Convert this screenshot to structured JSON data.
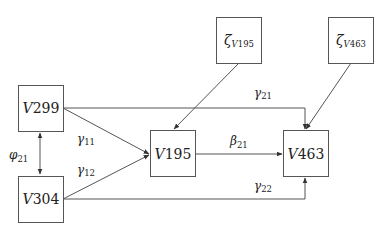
{
  "diagram": {
    "type": "path-diagram",
    "nodes": [
      {
        "id": "V299",
        "prefix": "V",
        "num": "299"
      },
      {
        "id": "V304",
        "prefix": "V",
        "num": "304"
      },
      {
        "id": "V195",
        "prefix": "V",
        "num": "195"
      },
      {
        "id": "V463",
        "prefix": "V",
        "num": "463"
      },
      {
        "id": "zetaV195",
        "greek": "ζ",
        "sub_var": "V",
        "sub_num": "195"
      },
      {
        "id": "zetaV463",
        "greek": "ζ",
        "sub_var": "V",
        "sub_num": "463"
      }
    ],
    "edges": [
      {
        "from": "V299",
        "to": "V304",
        "type": "bidirectional",
        "label_greek": "φ",
        "label_sub": "21"
      },
      {
        "from": "V299",
        "to": "V195",
        "type": "directed",
        "label_greek": "γ",
        "label_sub": "11"
      },
      {
        "from": "V304",
        "to": "V195",
        "type": "directed",
        "label_greek": "γ",
        "label_sub": "12"
      },
      {
        "from": "V299",
        "to": "V463",
        "type": "directed",
        "label_greek": "γ",
        "label_sub": "21"
      },
      {
        "from": "V304",
        "to": "V463",
        "type": "directed",
        "label_greek": "γ",
        "label_sub": "22"
      },
      {
        "from": "V195",
        "to": "V463",
        "type": "directed",
        "label_greek": "β",
        "label_sub": "21"
      },
      {
        "from": "zetaV195",
        "to": "V195",
        "type": "directed"
      },
      {
        "from": "zetaV463",
        "to": "V463",
        "type": "directed"
      }
    ]
  }
}
